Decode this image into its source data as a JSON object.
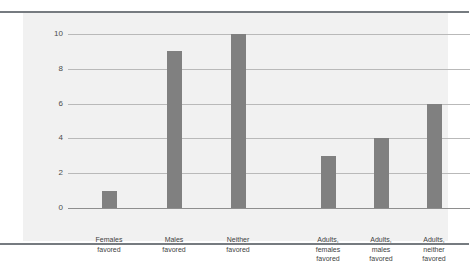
{
  "chart_data": {
    "type": "bar",
    "title": "",
    "subtitle": "",
    "xlabel": "",
    "ylabel": "",
    "ylim": [
      0,
      10
    ],
    "yticks": [
      "0",
      "2",
      "4",
      "6",
      "8",
      "10"
    ],
    "ytick_values": [
      0,
      2,
      4,
      6,
      8,
      10
    ],
    "grid": true,
    "legend": "none",
    "categories": [
      "Females\nfavored",
      "Males\nfavored",
      "Neither\nfavored",
      "Adults,\nfemales\nfavored",
      "Adults,\nmales\nfavored",
      "Adults,\nneither\nfavored"
    ],
    "values": [
      1,
      9,
      10,
      3,
      4,
      6
    ],
    "bars": [
      {
        "label": "Females\nfavored",
        "value": 1
      },
      {
        "label": "Males\nfavored",
        "value": 9
      },
      {
        "label": "Neither\nfavored",
        "value": 10
      },
      {
        "label": "Adults,\nfemales\nfavored",
        "value": 3
      },
      {
        "label": "Adults,\nmales\nfavored",
        "value": 4
      },
      {
        "label": "Adults,\nneither\nfavored",
        "value": 6
      }
    ],
    "colors": {
      "bar": "#808080",
      "panel": "#f1f1f1",
      "gridline": "#b9b9b9",
      "axis": "#8e8e8e",
      "rule": "#767b80",
      "text": "#3f3f3f",
      "background": "#ffffff"
    }
  }
}
